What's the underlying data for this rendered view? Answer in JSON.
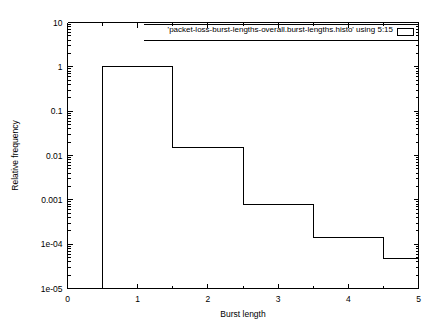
{
  "chart_data": {
    "type": "bar",
    "title": "",
    "subtitle": "",
    "xlabel": "Burst length",
    "ylabel": "Relative frequency",
    "xlim": [
      0,
      5
    ],
    "ylim": [
      1e-05,
      10
    ],
    "yscale": "log",
    "xscale": "linear",
    "grid": false,
    "legend_position": "top-right-inside",
    "legend_entries": [
      "'packet-loss-burst-lengths-overall.burst-lengths.histo' using 5:15"
    ],
    "style": "step-histogram-outline",
    "categories": [
      "1",
      "2",
      "3",
      "4",
      "5"
    ],
    "values": [
      1.0,
      0.015,
      0.0008,
      0.00014,
      4.8e-05
    ],
    "bins": [
      {
        "x_start": 0.5,
        "x_end": 1.5,
        "value": 1.0
      },
      {
        "x_start": 1.5,
        "x_end": 2.5,
        "value": 0.015
      },
      {
        "x_start": 2.5,
        "x_end": 3.5,
        "value": 0.0008
      },
      {
        "x_start": 3.5,
        "x_end": 4.5,
        "value": 0.00014
      },
      {
        "x_start": 4.5,
        "x_end": 5.0,
        "value": 4.8e-05
      }
    ],
    "xticks": [
      {
        "value": 0,
        "label": "0"
      },
      {
        "value": 1,
        "label": "1"
      },
      {
        "value": 2,
        "label": "2"
      },
      {
        "value": 3,
        "label": "3"
      },
      {
        "value": 4,
        "label": "4"
      },
      {
        "value": 5,
        "label": "5"
      }
    ],
    "yticks": [
      {
        "value": 10,
        "label": "10"
      },
      {
        "value": 1,
        "label": "1"
      },
      {
        "value": 0.1,
        "label": "0.1"
      },
      {
        "value": 0.01,
        "label": "0.01"
      },
      {
        "value": 0.001,
        "label": "0.001"
      },
      {
        "value": 0.0001,
        "label": "1e-04"
      },
      {
        "value": 1e-05,
        "label": "1e-05"
      }
    ],
    "colors": {
      "axis": "#000000",
      "series": "#000000",
      "background": "#ffffff"
    }
  }
}
